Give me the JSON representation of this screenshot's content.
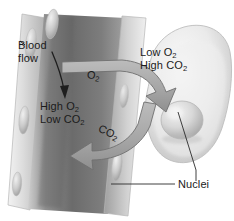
{
  "figure": {
    "width": 234,
    "height": 221,
    "background_color": "#ffffff",
    "style": "grayscale anatomical illustration"
  },
  "labels": {
    "blood_flow": "Blood\nflow",
    "blood_flow_line1": "Blood",
    "blood_flow_line2": "flow",
    "vessel_gas_line1": "High O",
    "vessel_gas_line1_sub": "2",
    "vessel_gas_line2": "Low CO",
    "vessel_gas_line2_sub": "2",
    "cell_gas_line1": "Low O",
    "cell_gas_line1_sub": "2",
    "cell_gas_line2": "High CO",
    "cell_gas_line2_sub": "2",
    "nuclei": "Nuclei",
    "o2_arrow": "O",
    "o2_arrow_sub": "2",
    "co2_arrow": "CO",
    "co2_arrow_sub": "2"
  },
  "structures": {
    "blood_vessel": "capillary",
    "tissue_cell": "tissue cell",
    "cell_nucleus": "nucleus",
    "endothelial_nucleus": "endothelial nucleus"
  },
  "arrows": {
    "o2_direction": "from blood vessel into tissue cell",
    "co2_direction": "from tissue cell into blood vessel",
    "blood_flow_direction": "downward along vessel"
  },
  "colors": {
    "arrow_fill": "#a9a9a9",
    "arrow_stroke": "#6f6f6f",
    "vessel_dark": "#6e6e6e",
    "vessel_mid": "#9a9a9a",
    "vessel_light": "#e2e2e2",
    "cell_fill": "#e6e6e6",
    "cell_edge": "#b5b5b5",
    "nucleus_fill": "#d3d3d3",
    "text": "#1b1b1b",
    "leader_line": "#2a2a2a",
    "background": "#ffffff"
  }
}
